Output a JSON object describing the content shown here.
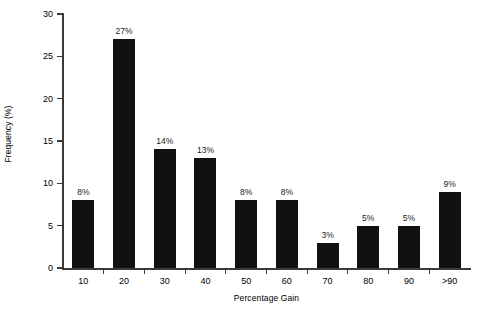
{
  "chart_data": {
    "type": "bar",
    "title": "",
    "subtitle": "",
    "xlabel": "Percentage Gain",
    "ylabel": "Frequency (%)",
    "categories": [
      "10",
      "20",
      "30",
      "40",
      "50",
      "60",
      "70",
      "80",
      "90",
      ">90"
    ],
    "values": [
      8,
      27,
      14,
      13,
      8,
      8,
      3,
      5,
      5,
      9
    ],
    "data_labels": [
      "8%",
      "27%",
      "14%",
      "13%",
      "8%",
      "8%",
      "3%",
      "5%",
      "5%",
      "9%"
    ],
    "ylim": [
      0,
      30
    ],
    "yticks": [
      0,
      5,
      10,
      15,
      20,
      25,
      30
    ],
    "ytick_labels": [
      "0",
      "5",
      "10",
      "15",
      "20",
      "25",
      "30"
    ],
    "grid": false,
    "legend": null,
    "bar_color": "#111111",
    "axis_color": "#3a3a3a",
    "background_color": "#ffffff"
  },
  "axes": {
    "y_title": "Frequency (%)",
    "x_title": "Percentage Gain"
  }
}
